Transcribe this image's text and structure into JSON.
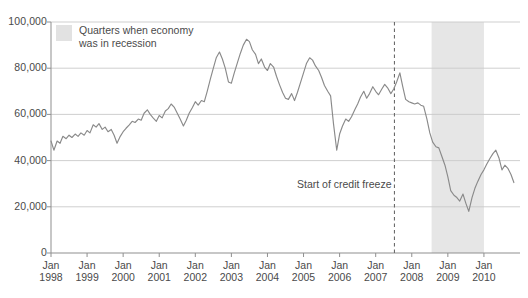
{
  "legend": {
    "label": "Quarters when economy was in recession",
    "swatch_color": "#e2e2e2",
    "swatch_name": "recession-band-swatch"
  },
  "annotations": {
    "credit_freeze": "Start of credit freeze"
  },
  "caption": {
    "text": ""
  },
  "chart_data": {
    "type": "line",
    "title": "",
    "subtitle": "",
    "xlabel": "",
    "ylabel": "",
    "ylim": [
      0,
      100000
    ],
    "xlim": [
      "Jan 1998",
      "Jan 2011"
    ],
    "grid": "horizontal",
    "legend_position": "top-left-inside",
    "line_color": "#8a8a8a",
    "gridline_color": "#c9c9c9",
    "axis_color": "#8f8f8f",
    "y_ticks": [
      0,
      20000,
      40000,
      60000,
      80000,
      100000
    ],
    "y_tick_labels": [
      "0",
      "20,000",
      "40,000",
      "60,000",
      "80,000",
      "100,000"
    ],
    "x_ticks": [
      1998,
      1999,
      2000,
      2001,
      2002,
      2003,
      2004,
      2005,
      2006,
      2007,
      2008,
      2009,
      2010
    ],
    "x_tick_labels": [
      {
        "month": "Jan",
        "year": "1998"
      },
      {
        "month": "Jan",
        "year": "1999"
      },
      {
        "month": "Jan",
        "year": "2000"
      },
      {
        "month": "Jan",
        "year": "2001"
      },
      {
        "month": "Jan",
        "year": "2002"
      },
      {
        "month": "Jan",
        "year": "2003"
      },
      {
        "month": "Jan",
        "year": "2004"
      },
      {
        "month": "Jan",
        "year": "2005"
      },
      {
        "month": "Jan",
        "year": "2006"
      },
      {
        "month": "Jan",
        "year": "2007"
      },
      {
        "month": "Jan",
        "year": "2008"
      },
      {
        "month": "Jan",
        "year": "2009"
      },
      {
        "month": "Jan",
        "year": "2010"
      }
    ],
    "shaded_regions": [
      {
        "name": "recession",
        "start": 2008.55,
        "end": 2010.0,
        "color": "#e6e6e6",
        "label": "Quarters when economy was in recession"
      }
    ],
    "vertical_markers": [
      {
        "name": "start-of-credit-freeze",
        "x": 2007.52,
        "style": "dashed",
        "color": "#6b6b6b",
        "label": "Start of credit freeze"
      }
    ],
    "series": [
      {
        "name": "value",
        "x": [
          1998.0,
          1998.08,
          1998.17,
          1998.25,
          1998.33,
          1998.42,
          1998.5,
          1998.58,
          1998.67,
          1998.75,
          1998.83,
          1998.92,
          1999.0,
          1999.08,
          1999.17,
          1999.25,
          1999.33,
          1999.42,
          1999.5,
          1999.58,
          1999.67,
          1999.75,
          1999.83,
          1999.92,
          2000.0,
          2000.08,
          2000.17,
          2000.25,
          2000.33,
          2000.42,
          2000.5,
          2000.58,
          2000.67,
          2000.75,
          2000.83,
          2000.92,
          2001.0,
          2001.08,
          2001.17,
          2001.25,
          2001.33,
          2001.42,
          2001.5,
          2001.58,
          2001.67,
          2001.75,
          2001.83,
          2001.92,
          2002.0,
          2002.08,
          2002.17,
          2002.25,
          2002.33,
          2002.42,
          2002.5,
          2002.58,
          2002.67,
          2002.75,
          2002.83,
          2002.92,
          2003.0,
          2003.08,
          2003.17,
          2003.25,
          2003.33,
          2003.42,
          2003.5,
          2003.58,
          2003.67,
          2003.75,
          2003.83,
          2003.92,
          2004.0,
          2004.08,
          2004.17,
          2004.25,
          2004.33,
          2004.42,
          2004.5,
          2004.58,
          2004.67,
          2004.75,
          2004.83,
          2004.92,
          2005.0,
          2005.08,
          2005.17,
          2005.25,
          2005.33,
          2005.42,
          2005.5,
          2005.58,
          2005.67,
          2005.75,
          2005.83,
          2005.92,
          2006.0,
          2006.08,
          2006.17,
          2006.25,
          2006.33,
          2006.42,
          2006.5,
          2006.58,
          2006.67,
          2006.75,
          2006.83,
          2006.92,
          2007.0,
          2007.08,
          2007.17,
          2007.25,
          2007.33,
          2007.42,
          2007.5,
          2007.58,
          2007.67,
          2007.75,
          2007.83,
          2007.92,
          2008.0,
          2008.08,
          2008.17,
          2008.25,
          2008.33,
          2008.42,
          2008.5,
          2008.58,
          2008.67,
          2008.75,
          2008.83,
          2008.92,
          2009.0,
          2009.08,
          2009.17,
          2009.25,
          2009.33,
          2009.42,
          2009.5,
          2009.58,
          2009.67,
          2009.75,
          2009.83,
          2009.92,
          2010.0,
          2010.08,
          2010.17,
          2010.25,
          2010.33,
          2010.42,
          2010.5,
          2010.58,
          2010.67,
          2010.75,
          2010.83
        ],
        "values": [
          48500,
          44500,
          48500,
          47500,
          50500,
          49500,
          51000,
          50000,
          51500,
          50500,
          52000,
          51000,
          53000,
          52000,
          55500,
          54500,
          56000,
          53500,
          54500,
          52500,
          53500,
          51000,
          47500,
          50500,
          52500,
          54000,
          55500,
          57000,
          56500,
          58000,
          57500,
          60500,
          62000,
          60000,
          58500,
          57000,
          59500,
          58500,
          61500,
          62500,
          64500,
          63000,
          60500,
          58000,
          55000,
          57500,
          60500,
          63000,
          65500,
          64000,
          66000,
          65500,
          70000,
          75500,
          80000,
          84500,
          87000,
          84000,
          80000,
          74000,
          73500,
          78000,
          82500,
          86500,
          90000,
          92500,
          91500,
          88000,
          86000,
          82000,
          84000,
          80500,
          79000,
          82000,
          80500,
          76500,
          73000,
          69500,
          67000,
          66500,
          69000,
          66000,
          69500,
          74000,
          78000,
          82000,
          84500,
          83500,
          81000,
          79000,
          76000,
          72500,
          70000,
          68000,
          56000,
          44500,
          51500,
          55000,
          58000,
          57000,
          59000,
          62000,
          64500,
          67500,
          70000,
          67000,
          69000,
          72000,
          70000,
          68500,
          71000,
          73000,
          71500,
          69000,
          71000,
          74000,
          78000,
          72000,
          66500,
          65500,
          65000,
          64500,
          65000,
          64000,
          63500,
          58000,
          52000,
          48000,
          46000,
          45500,
          42000,
          38000,
          33000,
          27000,
          25000,
          24000,
          22500,
          25500,
          21500,
          18000,
          24000,
          28000,
          31000,
          34000,
          36000,
          38500,
          41000,
          43000,
          44500,
          41000,
          36000,
          38000,
          36500,
          34000,
          30500
        ]
      }
    ]
  }
}
